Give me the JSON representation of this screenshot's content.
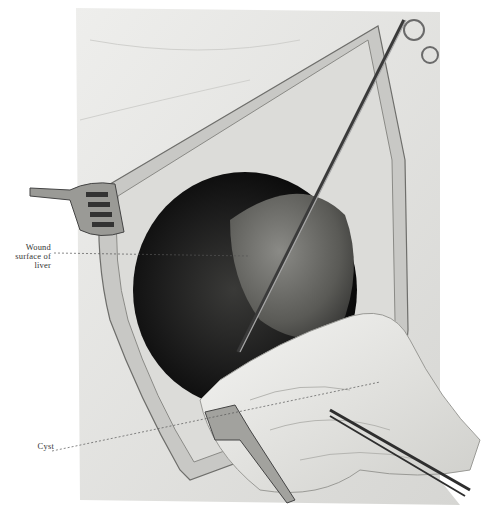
{
  "figure": {
    "labels": {
      "wound": [
        "Wound",
        "surface of",
        "liver"
      ],
      "cyst": "Cyst"
    },
    "colors": {
      "background": "#ffffff",
      "drape": "#e6e6e4",
      "cavity": "#141414",
      "liver": "#5a5a58",
      "wound_edge": "#b9b9b6",
      "instrument": "#8a8a8a",
      "cyst": "#e9e9e6",
      "label_text": "#333333"
    }
  }
}
